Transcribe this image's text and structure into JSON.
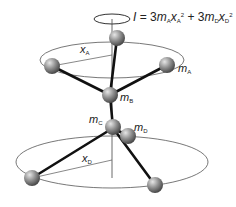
{
  "formula": {
    "I": "I",
    "eq": " = 3",
    "mA": "m",
    "subA": "A",
    "xA": "x",
    "subA2": "A",
    "sq1": "2",
    "plus": " + 3",
    "mD": "m",
    "subD": "D",
    "xD": "x",
    "subD2": "D",
    "sq2": "2"
  },
  "labels": {
    "xA": {
      "main": "x",
      "sub": "A"
    },
    "mA": {
      "main": "m",
      "sub": "A"
    },
    "mB": {
      "main": "m",
      "sub": "B"
    },
    "mC": {
      "main": "m",
      "sub": "C"
    },
    "mD": {
      "main": "m",
      "sub": "D"
    },
    "xD": {
      "main": "x",
      "sub": "D"
    }
  },
  "colors": {
    "sphere": "#8a8a8a",
    "bond": "#111111",
    "orbit": "#555555"
  }
}
